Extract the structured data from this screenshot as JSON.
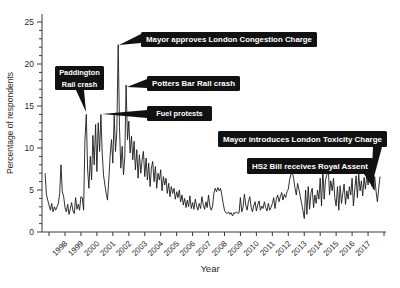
{
  "figure": {
    "background": "#ffffff",
    "line_color": "#1b1b1b",
    "axis_color": "#3a3a3a",
    "tick_label_color": "#2a2a2a",
    "annotation_bg": "#111111",
    "annotation_fg": "#ffffff"
  },
  "chart_data": {
    "type": "line",
    "title": "",
    "xlabel": "Year",
    "ylabel": "Percentage of respondents",
    "legend": "none",
    "grid": false,
    "ylim": [
      0,
      25
    ],
    "y_major_ticks": [
      0,
      5,
      10,
      15,
      20,
      25
    ],
    "y_minor_step": 1,
    "x_tick_labels": [
      "1998",
      "1999",
      "2000",
      "2001",
      "2002",
      "2003",
      "2004",
      "2005",
      "2006",
      "2007",
      "2008",
      "2009",
      "2010",
      "2011",
      "2012",
      "2013",
      "2014",
      "2015",
      "2016",
      "2017"
    ],
    "x_unlabeled_tick_years": [
      1997,
      2018
    ],
    "series_name": "Percentage of respondents citing transport concerns",
    "x_start_year_fraction": 1996.75,
    "points_per_year": 12,
    "values": [
      7.0,
      4.5,
      3.8,
      3.2,
      2.6,
      3.4,
      2.4,
      3.0,
      2.6,
      3.0,
      3.4,
      4.6,
      8.0,
      4.8,
      4.2,
      2.9,
      2.4,
      3.3,
      2.1,
      2.8,
      3.5,
      2.5,
      2.2,
      4.1,
      2.7,
      3.3,
      2.6,
      4.2,
      4.1,
      2.6,
      10.8,
      14.0,
      7.5,
      5.2,
      9.0,
      6.2,
      11.5,
      8.0,
      12.8,
      7.2,
      13.0,
      9.6,
      14.0,
      9.4,
      6.8,
      5.6,
      4.6,
      3.8,
      6.4,
      9.2,
      11.0,
      8.2,
      13.9,
      9.6,
      12.0,
      22.3,
      12.4,
      7.6,
      10.2,
      6.8,
      9.0,
      17.5,
      11.0,
      13.2,
      9.4,
      11.4,
      8.6,
      10.8,
      7.4,
      9.8,
      6.4,
      9.2,
      7.0,
      8.6,
      9.6,
      6.6,
      8.8,
      6.2,
      8.2,
      5.4,
      7.6,
      8.4,
      6.0,
      7.8,
      5.2,
      7.0,
      6.2,
      7.4,
      4.9,
      6.6,
      5.6,
      6.4,
      4.6,
      5.8,
      4.2,
      5.4,
      4.6,
      5.2,
      3.9,
      4.8,
      4.1,
      5.0,
      3.6,
      4.4,
      3.2,
      4.0,
      2.9,
      3.8,
      3.0,
      4.3,
      2.8,
      3.5,
      2.7,
      3.9,
      3.1,
      2.6,
      3.4,
      2.8,
      4.2,
      3.3,
      2.7,
      3.6,
      2.9,
      4.4,
      3.1,
      2.6,
      3.0,
      4.6,
      5.2,
      4.8,
      5.3,
      4.9,
      5.2,
      4.4,
      3.4,
      2.6,
      2.3,
      2.2,
      2.4,
      2.1,
      2.3,
      1.9,
      2.3,
      2.2,
      2.4,
      2.2,
      2.3,
      4.1,
      2.4,
      3.0,
      4.5,
      3.2,
      2.6,
      3.6,
      4.2,
      3.0,
      2.4,
      3.1,
      3.6,
      2.5,
      3.2,
      3.7,
      2.6,
      3.1,
      2.8,
      3.6,
      2.9,
      2.5,
      3.4,
      2.6,
      2.9,
      3.4,
      4.1,
      2.8,
      3.9,
      4.4,
      3.6,
      4.2,
      4.7,
      3.8,
      4.5,
      4.1,
      4.8,
      5.1,
      6.2,
      6.9,
      7.1,
      6.4,
      5.3,
      4.4,
      5.8,
      5.1,
      4.2,
      3.4,
      2.6,
      1.6,
      5.0,
      2.1,
      5.4,
      2.7,
      4.6,
      5.2,
      2.9,
      4.4,
      3.4,
      5.0,
      3.9,
      6.4,
      3.1,
      7.4,
      3.9,
      6.2,
      6.8,
      8.0,
      4.4,
      6.1,
      4.9,
      6.4,
      4.1,
      3.1,
      5.4,
      2.6,
      5.5,
      3.4,
      4.6,
      5.7,
      3.3,
      4.9,
      3.9,
      5.4,
      4.4,
      6.4,
      3.1,
      5.1,
      6.7,
      4.1,
      6.9,
      4.9,
      6.1,
      4.3,
      6.5,
      5.1,
      6.7,
      5.6,
      7.1,
      5.9,
      6.4,
      5.1,
      6.6,
      4.9,
      3.6,
      5.2,
      6.6
    ],
    "annotations": [
      {
        "id": "paddington-rail-crash",
        "lines": [
          "Paddington",
          "Rail crash"
        ],
        "peak_value": 14.0,
        "box": [
          55,
          66,
          49,
          24
        ],
        "pointer": [
          [
            76,
            90
          ],
          [
            86,
            112
          ],
          [
            84,
            90
          ]
        ]
      },
      {
        "id": "mayor-approves-london-congestion-charge",
        "lines": [
          "Mayor approves London Congestion Charge"
        ],
        "peak_value": 22.3,
        "box": [
          141,
          32,
          176,
          15
        ],
        "fit": true,
        "pointer": [
          [
            141,
            34
          ],
          [
            119,
            45
          ],
          [
            141,
            43
          ]
        ]
      },
      {
        "id": "potters-bar-rail-crash",
        "lines": [
          "Potters Bar Rail crash"
        ],
        "peak_value": 17.5,
        "box": [
          147,
          76,
          93,
          15
        ],
        "fit": true,
        "pointer": [
          [
            147,
            79
          ],
          [
            127,
            87
          ],
          [
            147,
            88
          ]
        ]
      },
      {
        "id": "fuel-protests",
        "lines": [
          "Fuel protests"
        ],
        "peak_value": 14.0,
        "box": [
          147,
          106,
          65,
          15
        ],
        "pointer": [
          [
            147,
            110
          ],
          [
            102,
            114
          ],
          [
            147,
            118
          ]
        ]
      },
      {
        "id": "mayor-introduces-london-toxicity-charge",
        "lines": [
          "Mayor introduces London Toxicity Charge"
        ],
        "peak_value": 6.6,
        "box": [
          218,
          131,
          169,
          16
        ],
        "fit": true,
        "pointer": [
          [
            373,
            147
          ],
          [
            371,
            188
          ],
          [
            382,
            147
          ]
        ]
      },
      {
        "id": "hs2-bill-receives-royal-assent",
        "lines": [
          "HS2 Bill receives Royal Assent"
        ],
        "peak_value": 7.1,
        "box": [
          247,
          158,
          126,
          16
        ],
        "fit": true,
        "pointer": [
          [
            364,
            174
          ],
          [
            375,
            191
          ],
          [
            373,
            167
          ]
        ]
      }
    ]
  }
}
